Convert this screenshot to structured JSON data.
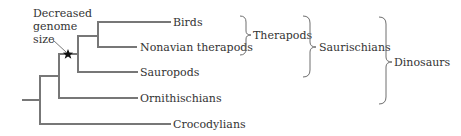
{
  "diagram": {
    "type": "phylogenetic-tree",
    "annotation": {
      "lines": [
        "Decreased",
        "genome",
        "size"
      ],
      "marker": "star"
    },
    "taxa": [
      {
        "name": "Birds"
      },
      {
        "name": "Nonavian therapods"
      },
      {
        "name": "Sauropods"
      },
      {
        "name": "Ornithischians"
      },
      {
        "name": "Crocodylians"
      }
    ],
    "groups": [
      {
        "name": "Therapods",
        "includes": [
          "Birds",
          "Nonavian therapods"
        ]
      },
      {
        "name": "Saurischians",
        "includes": [
          "Birds",
          "Nonavian therapods",
          "Sauropods"
        ]
      },
      {
        "name": "Dinosaurs",
        "includes": [
          "Birds",
          "Nonavian therapods",
          "Sauropods",
          "Ornithischians"
        ]
      }
    ],
    "colors": {
      "branch": "#777777",
      "text": "#333333",
      "star": "#111111"
    }
  }
}
